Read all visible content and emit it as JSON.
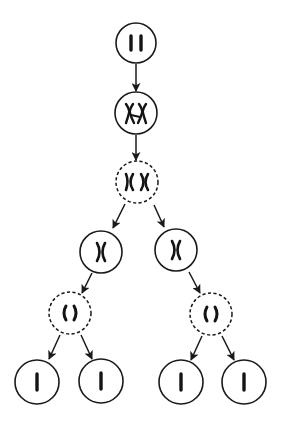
{
  "diagram": {
    "colors": {
      "stroke": "#1a1a1a",
      "chromosome": "#141414",
      "background": "#ffffff"
    },
    "nodes": [
      {
        "id": "parent-cell",
        "label": "Parent cell with homologous chromosome pair",
        "border": "solid",
        "content": "two-single-chromosomes",
        "cx": 136,
        "cy": 43,
        "r": 20
      },
      {
        "id": "tetrad-cell",
        "label": "Replicated chromosomes (tetrad)",
        "border": "solid",
        "content": "two-replicated-chromosomes-paired",
        "cx": 136,
        "cy": 113,
        "r": 21
      },
      {
        "id": "meiosis1-cell",
        "label": "Meiosis I dividing cell",
        "border": "dashed",
        "content": "two-replicated-chromosomes-separating",
        "cx": 137,
        "cy": 182,
        "r": 21
      },
      {
        "id": "daughter-left",
        "label": "Meiosis I daughter cell (left)",
        "border": "solid",
        "content": "one-replicated-chromosome",
        "cx": 101,
        "cy": 252,
        "r": 21
      },
      {
        "id": "daughter-right",
        "label": "Meiosis I daughter cell (right)",
        "border": "solid",
        "content": "one-replicated-chromosome",
        "cx": 176,
        "cy": 250,
        "r": 21
      },
      {
        "id": "meiosis2-left",
        "label": "Meiosis II dividing cell (left)",
        "border": "dashed",
        "content": "sister-chromatids-separating",
        "cx": 70,
        "cy": 313,
        "r": 21
      },
      {
        "id": "meiosis2-right",
        "label": "Meiosis II dividing cell (right)",
        "border": "dashed",
        "content": "sister-chromatids-separating",
        "cx": 211,
        "cy": 314,
        "r": 21
      },
      {
        "id": "gamete-1",
        "label": "Gamete 1",
        "border": "solid",
        "content": "single-chromatid",
        "cx": 37,
        "cy": 382,
        "r": 22
      },
      {
        "id": "gamete-2",
        "label": "Gamete 2",
        "border": "solid",
        "content": "single-chromatid",
        "cx": 101,
        "cy": 381,
        "r": 22
      },
      {
        "id": "gamete-3",
        "label": "Gamete 3",
        "border": "solid",
        "content": "single-chromatid",
        "cx": 181,
        "cy": 382,
        "r": 22
      },
      {
        "id": "gamete-4",
        "label": "Gamete 4",
        "border": "solid",
        "content": "single-chromatid",
        "cx": 244,
        "cy": 382,
        "r": 22
      }
    ],
    "edges": [
      {
        "from": "parent-cell",
        "to": "tetrad-cell"
      },
      {
        "from": "tetrad-cell",
        "to": "meiosis1-cell"
      },
      {
        "from": "meiosis1-cell",
        "to": "daughter-left"
      },
      {
        "from": "meiosis1-cell",
        "to": "daughter-right"
      },
      {
        "from": "daughter-left",
        "to": "meiosis2-left"
      },
      {
        "from": "daughter-right",
        "to": "meiosis2-right"
      },
      {
        "from": "meiosis2-left",
        "to": "gamete-1"
      },
      {
        "from": "meiosis2-left",
        "to": "gamete-2"
      },
      {
        "from": "meiosis2-right",
        "to": "gamete-3"
      },
      {
        "from": "meiosis2-right",
        "to": "gamete-4"
      }
    ]
  }
}
